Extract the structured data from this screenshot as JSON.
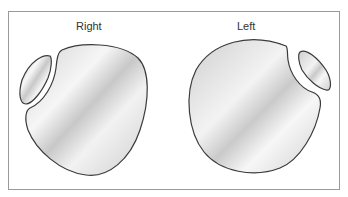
{
  "diagram": {
    "panels": [
      {
        "id": "right",
        "label": "Right"
      },
      {
        "id": "left",
        "label": "Left"
      }
    ],
    "colors": {
      "outline": "#3a3a3a",
      "fill_light": "#f4f4f4",
      "fill_dark": "#c9c9c9",
      "frame": "#9a9a9a"
    }
  }
}
